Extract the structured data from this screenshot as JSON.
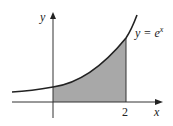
{
  "diagram": {
    "function_label": "y = e",
    "function_exponent": "x",
    "axis_x_label": "x",
    "axis_y_label": "y",
    "tick_label": "2",
    "shaded_region": {
      "from": 0,
      "to": 2
    },
    "colors": {
      "curve": "#222222",
      "shade": "#a8a8a8",
      "axes": "#333333"
    }
  }
}
